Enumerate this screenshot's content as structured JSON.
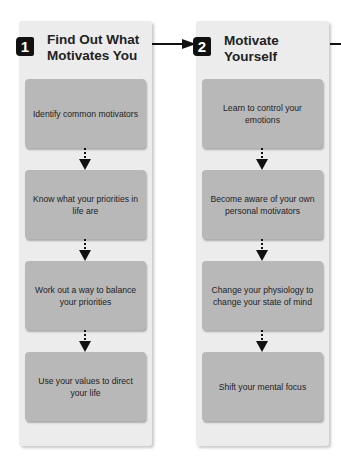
{
  "diagram": {
    "colors": {
      "panel_background": "#ececec",
      "step_box": "#b8b8b8",
      "badge": "#111111",
      "arrow": "#111111",
      "text": "#1e1e1e"
    },
    "stages": [
      {
        "number": "1",
        "title": "Find Out What Motivates You",
        "steps": [
          "Identify common motivators",
          "Know what your priorities in life are",
          "Work out a way to balance your priorities",
          "Use your values to direct your life"
        ]
      },
      {
        "number": "2",
        "title": "Motivate Yourself",
        "steps": [
          "Learn to control your emotions",
          "Become aware of your own personal motivators",
          "Change your physiology to change your state of mind",
          "Shift your mental focus"
        ]
      }
    ]
  }
}
